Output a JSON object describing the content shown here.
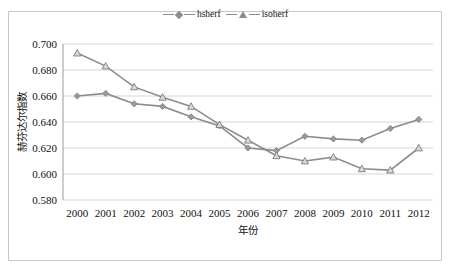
{
  "chart_data": {
    "type": "line",
    "title": "",
    "xlabel": "年份",
    "ylabel": "赫芬达尔指数",
    "categories": [
      "2000",
      "2001",
      "2002",
      "2003",
      "2004",
      "2005",
      "2006",
      "2007",
      "2008",
      "2009",
      "2010",
      "2011",
      "2012"
    ],
    "ylim": [
      0.58,
      0.7
    ],
    "ytick_labels": [
      "0.700",
      "0.680",
      "0.660",
      "0.640",
      "0.620",
      "0.600",
      "0.580"
    ],
    "ytick_values": [
      0.7,
      0.68,
      0.66,
      0.64,
      0.62,
      0.6,
      0.58
    ],
    "grid": true,
    "legend_position": "top-center",
    "series": [
      {
        "name": "hsherf",
        "marker": "diamond",
        "color": "#8c8c8c",
        "values": [
          0.66,
          0.662,
          0.654,
          0.652,
          0.644,
          0.637,
          0.62,
          0.618,
          0.629,
          0.627,
          0.626,
          0.635,
          0.642
        ]
      },
      {
        "name": "isoherf",
        "marker": "triangle",
        "color": "#8c8c8c",
        "values": [
          0.693,
          0.683,
          0.667,
          0.659,
          0.652,
          0.638,
          0.626,
          0.614,
          0.61,
          0.613,
          0.604,
          0.603,
          0.62
        ]
      }
    ]
  },
  "legend": {
    "entries": [
      {
        "label": "hsherf",
        "marker": "diamond-marker-icon"
      },
      {
        "label": "isoherf",
        "marker": "triangle-marker-icon"
      }
    ]
  }
}
